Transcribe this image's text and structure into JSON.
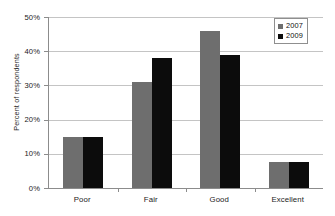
{
  "chart_data": {
    "type": "bar",
    "title": "",
    "xlabel": "",
    "ylabel": "Percent of respondents",
    "categories": [
      "Poor",
      "Fair",
      "Good",
      "Excellent"
    ],
    "series": [
      {
        "name": "2007",
        "color": "#6e6e6e",
        "values": [
          15,
          31,
          46,
          7.5
        ]
      },
      {
        "name": "2009",
        "color": "#0c0c0c",
        "values": [
          15,
          38,
          39,
          7.5
        ]
      }
    ],
    "ylim": [
      0,
      50
    ],
    "ytick_values": [
      0,
      10,
      20,
      30,
      40,
      50
    ],
    "ytick_labels": [
      "0%",
      "10%",
      "20%",
      "30%",
      "40%",
      "50%"
    ],
    "grid": true,
    "grid_axis": "y",
    "legend_position": "top-right",
    "legend_entries": [
      "2007",
      "2009"
    ]
  },
  "axes": {
    "y_title": "Percent of respondents"
  },
  "legend": {
    "items": [
      {
        "label": "2007"
      },
      {
        "label": "2009"
      }
    ]
  }
}
